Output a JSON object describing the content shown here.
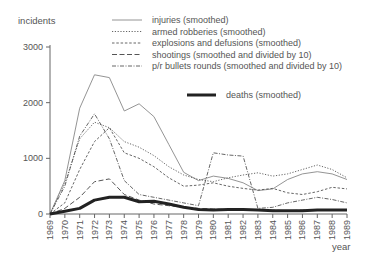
{
  "chart_data": {
    "type": "line",
    "title": "",
    "xlabel": "year",
    "ylabel": "incidents",
    "ylim": [
      0,
      3000
    ],
    "yticks": [
      "0",
      "1000",
      "2000",
      "3000"
    ],
    "grid": false,
    "legend_position": "top-right",
    "x": [
      "1969",
      "1970",
      "1971",
      "1972",
      "1973",
      "1974",
      "1975",
      "1976",
      "1977",
      "1978",
      "1979",
      "1980",
      "1981",
      "1982",
      "1983",
      "1984",
      "1985",
      "1986",
      "1987",
      "1988",
      "1989"
    ],
    "series": [
      {
        "name": "injuries (smoothed)",
        "style": "thin-solid",
        "values": [
          0,
          600,
          1900,
          2500,
          2450,
          1850,
          1980,
          1750,
          1250,
          750,
          600,
          680,
          640,
          560,
          420,
          450,
          620,
          720,
          760,
          720,
          620
        ]
      },
      {
        "name": "armed robberies (smoothed)",
        "style": "dotted",
        "values": [
          0,
          550,
          1350,
          1650,
          1550,
          1300,
          1200,
          1050,
          850,
          700,
          620,
          580,
          650,
          700,
          740,
          680,
          720,
          800,
          880,
          800,
          650
        ]
      },
      {
        "name": "explosions and defusions (smoothed)",
        "style": "dashed-fine",
        "values": [
          0,
          200,
          800,
          1300,
          1550,
          1100,
          1000,
          850,
          650,
          500,
          520,
          560,
          500,
          460,
          430,
          460,
          380,
          350,
          400,
          480,
          450
        ]
      },
      {
        "name": "shootings (smoothed and divided by 10)",
        "style": "dashed",
        "values": [
          0,
          100,
          300,
          580,
          630,
          350,
          250,
          180,
          150,
          120,
          100,
          90,
          80,
          80,
          70,
          70,
          60,
          70,
          80,
          80,
          80
        ]
      },
      {
        "name": "p/r bullets rounds (smoothed and divided by 10)",
        "style": "dash-dot",
        "values": [
          0,
          500,
          1400,
          1800,
          1350,
          600,
          350,
          300,
          250,
          200,
          150,
          1100,
          1060,
          1040,
          100,
          120,
          200,
          250,
          300,
          260,
          200
        ]
      },
      {
        "name": "deaths (smoothed)",
        "style": "thick-solid",
        "values": [
          0,
          50,
          100,
          250,
          300,
          300,
          220,
          230,
          180,
          120,
          80,
          70,
          80,
          80,
          70,
          60,
          60,
          60,
          70,
          70,
          70
        ]
      }
    ]
  },
  "legend": {
    "items": [
      "injuries (smoothed)",
      "armed robberies (smoothed)",
      "explosions and defusions  (smoothed)",
      "shootings (smoothed and divided by 10)",
      "p/r bullets rounds  (smoothed and divided by 10)"
    ],
    "deaths": "deaths  (smoothed)"
  },
  "axis": {
    "ylabel": "incidents",
    "xlabel": "year"
  }
}
